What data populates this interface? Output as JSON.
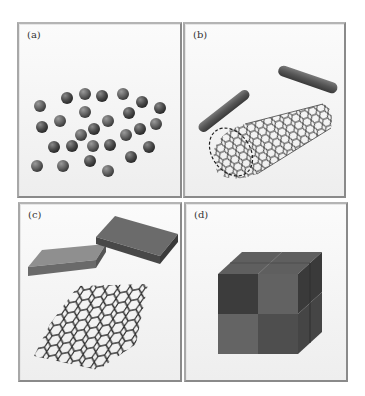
{
  "figure": {
    "panels": [
      {
        "id": "a",
        "label": "(a)",
        "depicts": "nanoparticles (0D spheres)"
      },
      {
        "id": "b",
        "label": "(b)",
        "depicts": "nanorods and carbon nanotube (1D)"
      },
      {
        "id": "c",
        "label": "(c)",
        "depicts": "nanoplates and graphene sheet (2D)"
      },
      {
        "id": "d",
        "label": "(d)",
        "depicts": "bulk nanostructured cube (3D)"
      }
    ]
  },
  "colors": {
    "frame": "#8a8a8a",
    "panel_bg": "#f6f6f6",
    "sphere_dark": "#3f3f3f",
    "sphere_mid": "#5e5e5e",
    "lattice": "#2a2a2a"
  }
}
